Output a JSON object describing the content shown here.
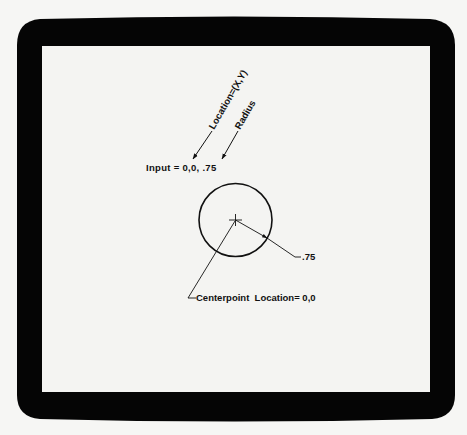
{
  "colors": {
    "background": "#f6f6f4",
    "bezel": "#050505",
    "screen": "#f4f4f2",
    "ink": "#111111"
  },
  "annotations": {
    "location_label": "Location=(X,Y)",
    "radius_label": "Radius",
    "input_text": "Input = 0,0, .75",
    "radius_value": ".75",
    "centerpoint_text": "Centerpoint  Location= 0,0"
  },
  "circle": {
    "center_x": 0,
    "center_y": 0,
    "radius": 0.75
  }
}
